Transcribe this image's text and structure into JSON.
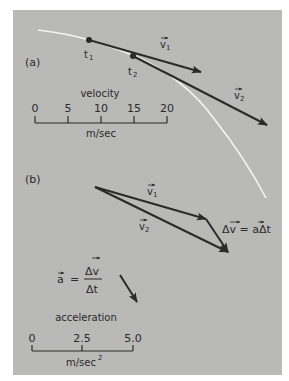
{
  "figure": {
    "part_a": {
      "label": "(a)",
      "points": [
        {
          "label": "t",
          "sub": "1"
        },
        {
          "label": "t",
          "sub": "2"
        }
      ],
      "vectors": [
        {
          "label": "v",
          "sub": "1"
        },
        {
          "label": "v",
          "sub": "2"
        }
      ],
      "velocity_scale": {
        "title": "velocity",
        "ticks": [
          "0",
          "5",
          "10",
          "15",
          "20"
        ],
        "unit": "m/sec"
      }
    },
    "part_b": {
      "label": "(b)",
      "vectors": [
        {
          "label": "v",
          "sub": "1"
        },
        {
          "label": "v",
          "sub": "2"
        }
      ],
      "delta_equation": "Δv = aΔt",
      "accel_equation": {
        "lhs": "a",
        "eq": "=",
        "numerator": "Δv",
        "denominator": "Δt"
      },
      "acceleration_scale": {
        "title": "acceleration",
        "ticks": [
          "0",
          "2.5",
          "5.0"
        ],
        "unit": "m/sec",
        "unit_sup": "2"
      }
    },
    "colors": {
      "panel": "#b9b9b7",
      "ink": "#2a2a2a",
      "trajectory": "#f4f4f4"
    }
  }
}
